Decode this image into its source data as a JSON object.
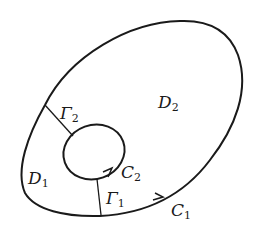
{
  "diagram": {
    "colors": {
      "stroke": "#1a1a1a",
      "background": "#ffffff"
    },
    "curves": [
      {
        "id": "C1",
        "label": "C",
        "sub": "1",
        "kind": "outer-boundary",
        "orientation": "counterclockwise"
      },
      {
        "id": "C2",
        "label": "C",
        "sub": "2",
        "kind": "inner-boundary",
        "orientation": "counterclockwise"
      }
    ],
    "cuts": [
      {
        "id": "Gamma1",
        "label": "Γ",
        "sub": "1"
      },
      {
        "id": "Gamma2",
        "label": "Γ",
        "sub": "2"
      }
    ],
    "regions": [
      {
        "id": "D1",
        "label": "D",
        "sub": "1"
      },
      {
        "id": "D2",
        "label": "D",
        "sub": "2"
      }
    ]
  },
  "labels": {
    "c1": {
      "main": "C",
      "sub": "1"
    },
    "c2": {
      "main": "C",
      "sub": "2"
    },
    "gamma1": {
      "main": "Γ",
      "sub": "1"
    },
    "gamma2": {
      "main": "Γ",
      "sub": "2"
    },
    "d1": {
      "main": "D",
      "sub": "1"
    },
    "d2": {
      "main": "D",
      "sub": "2"
    }
  }
}
